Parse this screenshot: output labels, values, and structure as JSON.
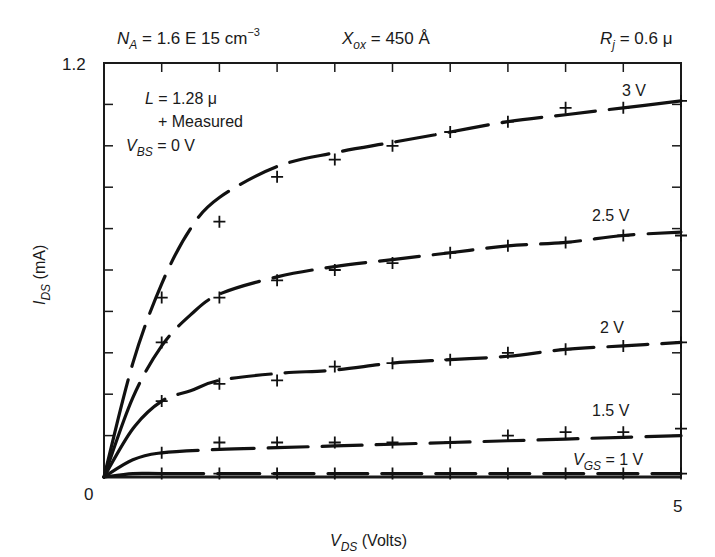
{
  "chart_data": {
    "type": "line",
    "title": "",
    "header_params": {
      "NA": "N_A = 1.6 E 15 cm^-3",
      "Xox": "X_ox = 450 Å",
      "Rj": "R_j = 0.6 μ"
    },
    "annotations": {
      "length": "L = 1.28 μ",
      "measured_legend": "+ Measured",
      "vbs": "V_BS = 0 V"
    },
    "xlabel": "V_DS (Volts)",
    "ylabel": "I_DS (mA)",
    "xlim": [
      0,
      5
    ],
    "ylim": [
      0,
      1.2
    ],
    "x_tick_labels": [
      "0",
      "5"
    ],
    "y_tick_labels": [
      "0",
      "1.2"
    ],
    "x_minor_step": 0.5,
    "y_minor_divisions": 10,
    "grid": false,
    "legend": "inline curve labels",
    "x": [
      0.5,
      1.0,
      1.5,
      2.0,
      2.5,
      3.0,
      3.5,
      4.0,
      4.5,
      5.0
    ],
    "series": [
      {
        "name": "3 V",
        "label": "3 V",
        "measured": [
          0.52,
          0.74,
          0.87,
          0.92,
          0.96,
          1.0,
          1.03,
          1.07,
          1.07,
          1.09
        ],
        "model": [
          [
            0,
            0
          ],
          [
            0.25,
            0.33
          ],
          [
            0.5,
            0.56
          ],
          [
            0.75,
            0.72
          ],
          [
            1.0,
            0.81
          ],
          [
            1.5,
            0.9
          ],
          [
            2.0,
            0.94
          ],
          [
            2.5,
            0.97
          ],
          [
            3.0,
            1.0
          ],
          [
            3.5,
            1.03
          ],
          [
            4.0,
            1.05
          ],
          [
            4.5,
            1.07
          ],
          [
            5.0,
            1.09
          ]
        ]
      },
      {
        "name": "2.5 V",
        "label": "2.5 V",
        "measured": [
          0.39,
          0.52,
          0.57,
          0.6,
          0.62,
          0.65,
          0.67,
          0.68,
          0.7,
          0.7
        ],
        "model": [
          [
            0,
            0
          ],
          [
            0.25,
            0.23
          ],
          [
            0.5,
            0.38
          ],
          [
            0.75,
            0.47
          ],
          [
            1.0,
            0.53
          ],
          [
            1.5,
            0.58
          ],
          [
            2.0,
            0.61
          ],
          [
            2.5,
            0.63
          ],
          [
            3.0,
            0.65
          ],
          [
            3.5,
            0.67
          ],
          [
            4.0,
            0.68
          ],
          [
            4.5,
            0.7
          ],
          [
            5.0,
            0.71
          ]
        ]
      },
      {
        "name": "2 V",
        "label": "2 V",
        "measured": [
          0.22,
          0.27,
          0.28,
          0.32,
          0.33,
          0.34,
          0.36,
          0.37,
          0.38,
          0.39
        ],
        "model": [
          [
            0,
            0
          ],
          [
            0.25,
            0.14
          ],
          [
            0.5,
            0.22
          ],
          [
            0.75,
            0.25
          ],
          [
            1.0,
            0.28
          ],
          [
            1.5,
            0.3
          ],
          [
            2.0,
            0.31
          ],
          [
            2.5,
            0.33
          ],
          [
            3.0,
            0.34
          ],
          [
            3.5,
            0.35
          ],
          [
            4.0,
            0.37
          ],
          [
            4.5,
            0.38
          ],
          [
            5.0,
            0.39
          ]
        ]
      },
      {
        "name": "1.5 V",
        "label": "1.5 V",
        "measured": [
          0.07,
          0.1,
          0.1,
          0.1,
          0.1,
          0.1,
          0.12,
          0.13,
          0.13,
          0.14
        ],
        "model": [
          [
            0,
            0
          ],
          [
            0.25,
            0.05
          ],
          [
            0.5,
            0.07
          ],
          [
            1.0,
            0.08
          ],
          [
            1.5,
            0.085
          ],
          [
            2.0,
            0.09
          ],
          [
            2.5,
            0.095
          ],
          [
            3.0,
            0.1
          ],
          [
            3.5,
            0.105
          ],
          [
            4.0,
            0.11
          ],
          [
            4.5,
            0.115
          ],
          [
            5.0,
            0.12
          ]
        ]
      },
      {
        "name": "1 V",
        "label": "V_GS = 1 V",
        "measured": [
          0.01,
          0.01,
          0.01,
          0.01,
          0.01,
          0.01,
          0.01,
          0.01,
          0.01,
          0.01
        ],
        "model": [
          [
            0,
            0
          ],
          [
            0.25,
            0.01
          ],
          [
            0.5,
            0.01
          ],
          [
            1.0,
            0.01
          ],
          [
            2.0,
            0.01
          ],
          [
            3.0,
            0.01
          ],
          [
            4.0,
            0.01
          ],
          [
            5.0,
            0.01
          ]
        ]
      }
    ]
  },
  "text": {
    "na_main": "N",
    "na_sub": "A",
    "na_rest": " = 1.6 E 15 cm",
    "na_sup": "−3",
    "xox_main": "X",
    "xox_sub": "ox",
    "xox_rest": " = 450 Å",
    "rj_main": "R",
    "rj_sub": "j",
    "rj_rest": " = 0.6 μ",
    "l_main": "L",
    "l_rest": " = 1.28 μ",
    "measured": "+ Measured",
    "vbs_main": "V",
    "vbs_sub": "BS",
    "vbs_rest": " = 0 V",
    "y_top": "1.2",
    "x_zero": "0",
    "x_five": "5",
    "xlabel_main": "V",
    "xlabel_sub": "DS",
    "xlabel_rest": " (Volts)",
    "ylabel_main": "I",
    "ylabel_sub": "DS",
    "ylabel_rest": " (mA)",
    "lbl_3": "3 V",
    "lbl_25": "2.5 V",
    "lbl_2": "2 V",
    "lbl_15": "1.5 V",
    "vgs_main": "V",
    "vgs_sub": "GS",
    "vgs_rest": " = 1 V"
  }
}
